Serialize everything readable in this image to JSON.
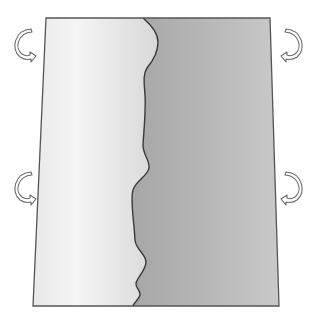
{
  "diagram": {
    "type": "sheet-with-torn-boundary",
    "description": "Rectangular sheet split vertically by a wavy boundary into a lighter left region and a darker right region, with four curved rotation arrows on the outer sides",
    "colors": {
      "background": "#ffffff",
      "outline": "#555555",
      "left_region_light": "#f4f4f4",
      "left_region_mid": "#dcdcdc",
      "right_region_light": "#c4c4c4",
      "right_region_dark": "#a9a9a9",
      "arrow_fill": "#ffffff",
      "arrow_stroke": "#6a6a6a"
    },
    "sheet": {
      "corners": {
        "top_left": [
          46,
          18
        ],
        "top_right": [
          270,
          18
        ],
        "bottom_right": [
          279,
          306
        ],
        "bottom_left": [
          33,
          306
        ]
      }
    },
    "boundary": {
      "label": "wavy dividing edge"
    },
    "regions": [
      {
        "name": "left-region",
        "shade": "light"
      },
      {
        "name": "right-region",
        "shade": "dark"
      }
    ],
    "arrows": [
      {
        "name": "top-left-arrow",
        "side": "left",
        "direction": "curl-down-right",
        "position": [
          24,
          44
        ]
      },
      {
        "name": "top-right-arrow",
        "side": "right",
        "direction": "curl-down-left",
        "position": [
          293,
          44
        ]
      },
      {
        "name": "bottom-left-arrow",
        "side": "left",
        "direction": "curl-down-right",
        "position": [
          24,
          187
        ]
      },
      {
        "name": "bottom-right-arrow",
        "side": "right",
        "direction": "curl-down-left",
        "position": [
          293,
          187
        ]
      }
    ]
  }
}
